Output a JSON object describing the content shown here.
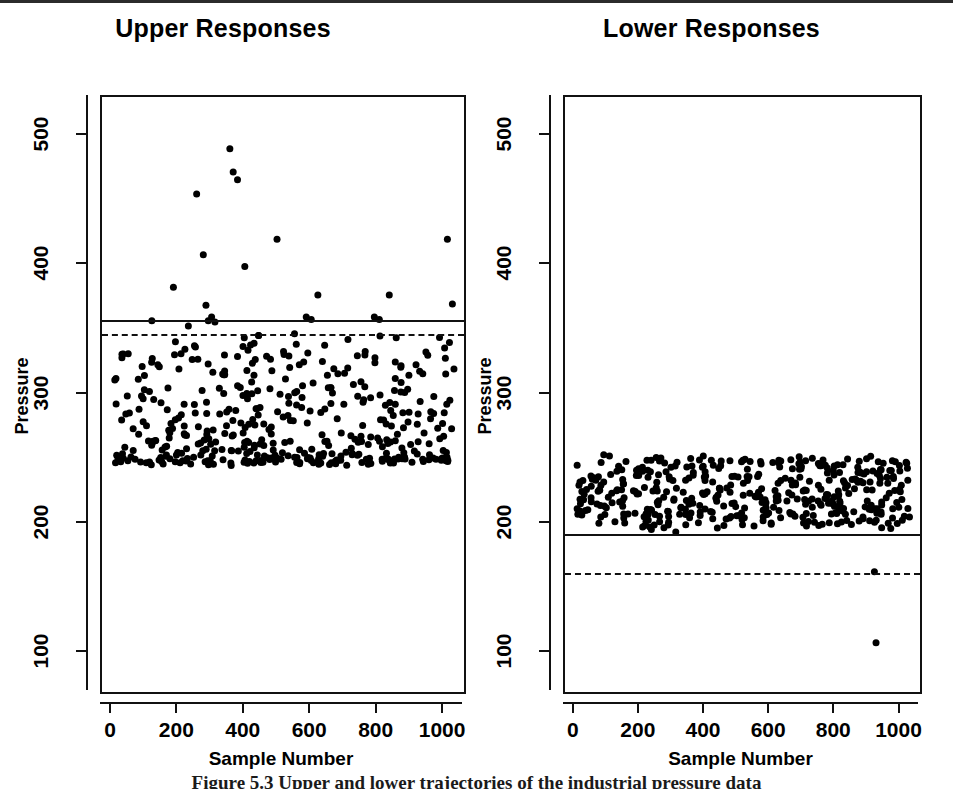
{
  "figure": {
    "caption": "Figure 5.3  Upper and lower trajectories of the industrial pressure data",
    "background_color": "#ffffff",
    "ink_color": "#111111"
  },
  "chart_data": [
    {
      "type": "scatter",
      "panel_id": "upper-responses",
      "title": "Upper Responses",
      "xlabel": "Sample Number",
      "ylabel": "Pressure",
      "xlim": [
        -30,
        1060
      ],
      "ylim": [
        70,
        530
      ],
      "xticks": [
        0,
        200,
        400,
        600,
        800,
        1000
      ],
      "xtick_labels": [
        "0",
        "200",
        "400",
        "600",
        "800",
        "1000"
      ],
      "yticks": [
        100,
        200,
        300,
        400,
        500
      ],
      "ytick_labels": [
        "100",
        "200",
        "300",
        "400",
        "500"
      ],
      "grid": false,
      "legend": "none",
      "marker": "filled-circle",
      "marker_color": "#000000",
      "marker_size_px": 7,
      "n_points": 430,
      "reference_lines": [
        {
          "name": "upper-control-limit-solid",
          "value": 358,
          "style": "solid",
          "color": "#111111"
        },
        {
          "name": "upper-control-limit-dashed",
          "value": 347,
          "style": "dashed",
          "color": "#111111"
        }
      ],
      "cluster": {
        "x_min": 5,
        "x_max": 1030,
        "y_base_min": 248,
        "y_base_max": 345,
        "y_mode": 262,
        "skew": 2.1
      },
      "outliers": [
        {
          "x": 120,
          "y": 357
        },
        {
          "x": 185,
          "y": 383
        },
        {
          "x": 230,
          "y": 353
        },
        {
          "x": 255,
          "y": 455
        },
        {
          "x": 275,
          "y": 408
        },
        {
          "x": 283,
          "y": 369
        },
        {
          "x": 290,
          "y": 357
        },
        {
          "x": 300,
          "y": 360
        },
        {
          "x": 310,
          "y": 356
        },
        {
          "x": 355,
          "y": 490
        },
        {
          "x": 365,
          "y": 472
        },
        {
          "x": 378,
          "y": 466
        },
        {
          "x": 400,
          "y": 399
        },
        {
          "x": 497,
          "y": 420
        },
        {
          "x": 585,
          "y": 360
        },
        {
          "x": 600,
          "y": 358
        },
        {
          "x": 620,
          "y": 377
        },
        {
          "x": 790,
          "y": 360
        },
        {
          "x": 805,
          "y": 358
        },
        {
          "x": 835,
          "y": 377
        },
        {
          "x": 1010,
          "y": 420
        },
        {
          "x": 1025,
          "y": 370
        }
      ]
    },
    {
      "type": "scatter",
      "panel_id": "lower-responses",
      "title": "Lower Responses",
      "xlabel": "Sample Number",
      "ylabel": "Pressure",
      "xlim": [
        -30,
        1060
      ],
      "ylim": [
        70,
        530
      ],
      "xticks": [
        0,
        200,
        400,
        600,
        800,
        1000
      ],
      "xtick_labels": [
        "0",
        "200",
        "400",
        "600",
        "800",
        "1000"
      ],
      "yticks": [
        100,
        200,
        300,
        400,
        500
      ],
      "ytick_labels": [
        "100",
        "200",
        "300",
        "400",
        "500"
      ],
      "grid": false,
      "legend": "none",
      "marker": "filled-circle",
      "marker_color": "#000000",
      "marker_size_px": 7,
      "n_points": 430,
      "reference_lines": [
        {
          "name": "lower-control-limit-solid",
          "value": 192,
          "style": "solid",
          "color": "#111111"
        },
        {
          "name": "lower-control-limit-dashed",
          "value": 162,
          "style": "dashed",
          "color": "#111111"
        }
      ],
      "cluster": {
        "x_min": 5,
        "x_max": 1030,
        "y_base_min": 196,
        "y_base_max": 252,
        "y_mode": 233,
        "skew": 1.0
      },
      "outliers": [
        {
          "x": 920,
          "y": 163
        },
        {
          "x": 925,
          "y": 108
        }
      ]
    }
  ]
}
